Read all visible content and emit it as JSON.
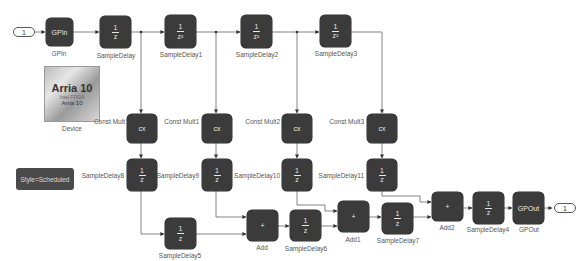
{
  "diagram": {
    "inport": {
      "label": "1"
    },
    "outport": {
      "label": "1"
    },
    "device": {
      "family": "Arria 10",
      "subtitle": "Arria 10",
      "tiny": "Intel FPGA",
      "caption": "Device"
    },
    "style_block": {
      "label": "Style=Scheduled"
    },
    "blocks": {
      "gpin": {
        "text": "GPIn",
        "caption": "GPIn"
      },
      "sd": {
        "num": "1",
        "den": "z",
        "caption": "SampleDelay"
      },
      "sd1": {
        "num": "1",
        "den": "z²",
        "caption": "SampleDelay1"
      },
      "sd2": {
        "num": "1",
        "den": "z²",
        "caption": "SampleDelay2"
      },
      "sd3": {
        "num": "1",
        "den": "z²",
        "caption": "SampleDelay3"
      },
      "cm": {
        "text": "cx",
        "caption": "Const Mult"
      },
      "cm1": {
        "text": "cx",
        "caption": "Const Mult1"
      },
      "cm2": {
        "text": "cx",
        "caption": "Const Mult2"
      },
      "cm3": {
        "text": "cx",
        "caption": "Const Mult3"
      },
      "sd8": {
        "num": "1",
        "den": "z",
        "caption": "SampleDelay8"
      },
      "sd9": {
        "num": "1",
        "den": "z",
        "caption": "SampleDelay9"
      },
      "sd10": {
        "num": "1",
        "den": "z",
        "caption": "SampleDelay10"
      },
      "sd11": {
        "num": "1",
        "den": "z",
        "caption": "SampleDelay11"
      },
      "sd5": {
        "num": "1",
        "den": "z",
        "caption": "SampleDelay5"
      },
      "add": {
        "text": "+",
        "caption": "Add"
      },
      "sd6": {
        "num": "1",
        "den": "z",
        "caption": "SampleDelay6"
      },
      "add1": {
        "text": "+",
        "caption": "Add1"
      },
      "sd7": {
        "num": "1",
        "den": "z",
        "caption": "SampleDelay7"
      },
      "add2": {
        "text": "+",
        "caption": "Add2"
      },
      "sd4": {
        "num": "1",
        "den": "z",
        "caption": "SampleDelay4"
      },
      "gpout": {
        "text": "GPOut",
        "caption": "GPOut"
      }
    }
  }
}
